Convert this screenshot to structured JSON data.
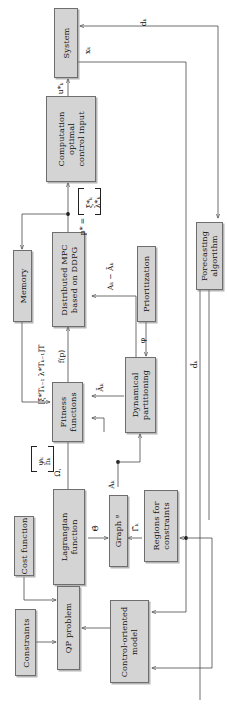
{
  "figure": {
    "kind": "block-diagram",
    "orientation": "rotated-90-ccw",
    "width": 227,
    "height": 719,
    "block_fill": "#d4d4d4",
    "block_stroke": "#6e6e6e",
    "wire_color": "#4a4a4a",
    "background": "#ffffff"
  },
  "blocks": {
    "system": {
      "label_line1": "System"
    },
    "computation": {
      "label_line1": "Computation",
      "label_line2": "optimal",
      "label_line3": "control input"
    },
    "memory": {
      "label_line1": "Memory"
    },
    "distributed_mpc": {
      "label_line1": "Distributed MPC",
      "label_line2": "based on DDPG"
    },
    "prioritization": {
      "label_line1": "Prioritization"
    },
    "fitness": {
      "label_line1": "Fitness",
      "label_line2": "functions"
    },
    "dynamical_partitioning": {
      "label_line1": "Dynamical",
      "label_line2": "partitioning"
    },
    "forecasting": {
      "label_line1": "Forecasting",
      "label_line2": "algorithm"
    },
    "lagrangian": {
      "label_line1": "Lagrangian",
      "label_line2": "function"
    },
    "graph": {
      "label_line1": "Graph ᵍ"
    },
    "regions": {
      "label_line1": "Regions for",
      "label_line2": "constraints"
    },
    "cost_function": {
      "label_line1": "Cost function"
    },
    "qp_problem": {
      "label_line1": "QP problem"
    },
    "constraints": {
      "label_line1": "Constraints"
    },
    "control_oriented_model": {
      "label_line1": "Control-oriented",
      "label_line2": "model"
    }
  },
  "signals": {
    "d_k": "dₖ",
    "x_k": "xₖ",
    "u_star_k": "u*ₖ",
    "p_star": "p* =",
    "p_star_vector_top": "ξ*ₖ",
    "p_star_vector_bottom": "λ*ₖ",
    "f_p": "f(p)",
    "A_k_minus_Abar_k": "Aₖ − Āₖ",
    "Abar_k": "Āₖ",
    "A_k": "Aₖ",
    "phi": "φ",
    "memory_feedback": "[ξ*Tₖ₋₁  λ*Tₖ₋₁]T",
    "omega": "Ω,",
    "psi_k": "ψₖ",
    "h_k": "hₖ",
    "theta_hat": "Θ̂",
    "gamma_hat_k": "Γ̂ₖ",
    "d_hat_k": "d̂ₖ"
  }
}
